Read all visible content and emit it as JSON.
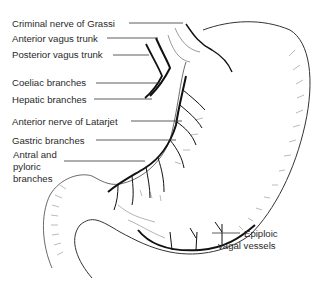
{
  "figure": {
    "labels": [
      {
        "id": "criminal-nerve",
        "text": "Criminal nerve of Grassi"
      },
      {
        "id": "anterior-vagus",
        "text": "Anterior vagus trunk"
      },
      {
        "id": "posterior-vagus",
        "text": "Posterior vagus trunk"
      },
      {
        "id": "coeliac",
        "text": "Coeliac branches"
      },
      {
        "id": "hepatic",
        "text": "Hepatic branches"
      },
      {
        "id": "latarjet",
        "text": "Anterior nerve of Latarjet"
      },
      {
        "id": "gastric",
        "text": "Gastric branches"
      },
      {
        "id": "antral-1",
        "text": "Antral and"
      },
      {
        "id": "antral-2",
        "text": "pyloric"
      },
      {
        "id": "antral-3",
        "text": "branches"
      },
      {
        "id": "epiploic-1",
        "text": "Epiploic"
      },
      {
        "id": "epiploic-2",
        "text": "vagal vessels"
      }
    ]
  }
}
